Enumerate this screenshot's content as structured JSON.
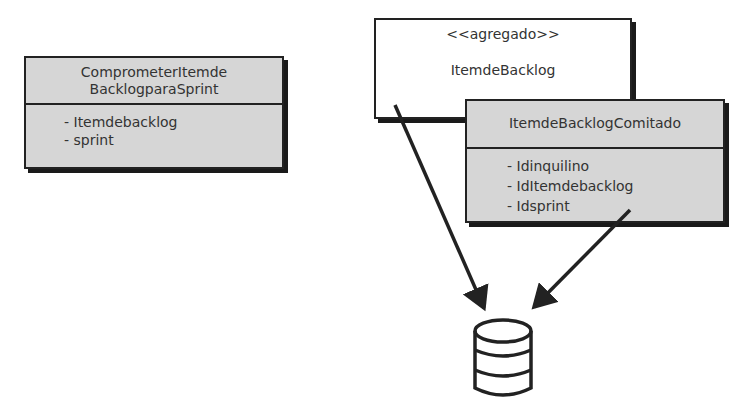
{
  "diagram": {
    "command_box": {
      "title_line1": "ComprometerItemde",
      "title_line2": "BacklogparaSprint",
      "attributes": [
        "- Itemdebacklog",
        "- sprint"
      ]
    },
    "aggregate_box": {
      "stereotype": "<<agregado>>",
      "name": "ItemdeBacklog"
    },
    "event_box": {
      "title": "ItemdeBacklogComitado",
      "attributes": [
        "- Idinquilino",
        "- IdItemdebacklog",
        "- Idsprint"
      ]
    },
    "database": {
      "icon": "database-icon"
    },
    "arrows": [
      {
        "from": "aggregate_box",
        "to": "database"
      },
      {
        "from": "event_box",
        "to": "database"
      }
    ],
    "colors": {
      "gray_fill": "#d6d6d6",
      "border": "#222222",
      "text": "#333333"
    }
  }
}
